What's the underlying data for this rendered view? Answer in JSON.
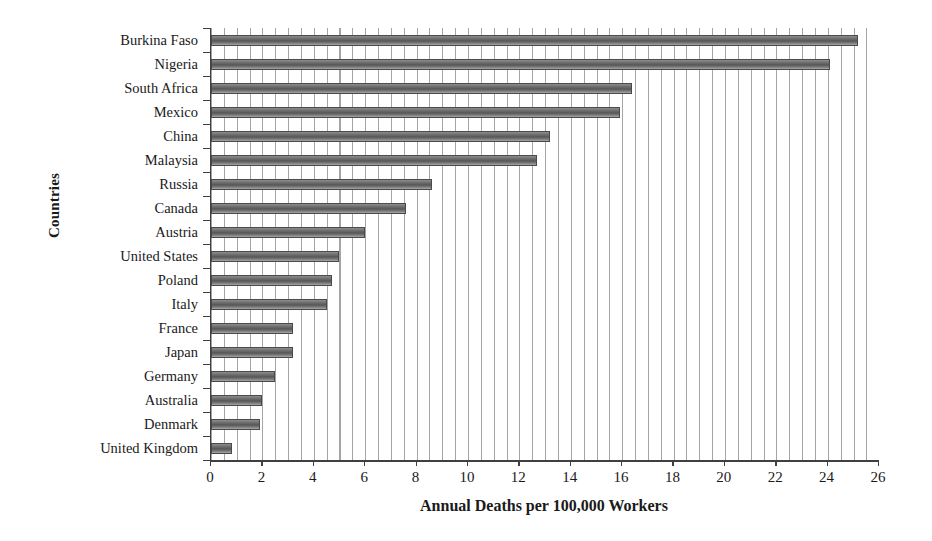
{
  "chart_data": {
    "type": "bar",
    "orientation": "horizontal",
    "title": "",
    "xlabel": "Annual Deaths per 100,000 Workers",
    "ylabel": "Countries",
    "xlim": [
      0,
      26
    ],
    "xticks": [
      0,
      2,
      4,
      6,
      8,
      10,
      12,
      14,
      16,
      18,
      20,
      22,
      24,
      26
    ],
    "xtick_labels": [
      "0",
      "2",
      "4",
      "6",
      "8",
      "10",
      "12",
      "14",
      "16",
      "18",
      "20",
      "22",
      "24",
      "26"
    ],
    "grid": "vertical-minor-dense",
    "legend": "none",
    "bar_color": "#6f6f6f",
    "categories": [
      "Burkina Faso",
      "Nigeria",
      "South Africa",
      "Mexico",
      "China",
      "Malaysia",
      "Russia",
      "Canada",
      "Austria",
      "United States",
      "Poland",
      "Italy",
      "France",
      "Japan",
      "Germany",
      "Australia",
      "Denmark",
      "United Kingdom"
    ],
    "values": [
      25.2,
      24.1,
      16.4,
      15.9,
      13.2,
      12.7,
      8.6,
      7.6,
      6.0,
      5.0,
      4.7,
      4.5,
      3.2,
      3.2,
      2.5,
      2.0,
      1.9,
      0.8
    ]
  }
}
